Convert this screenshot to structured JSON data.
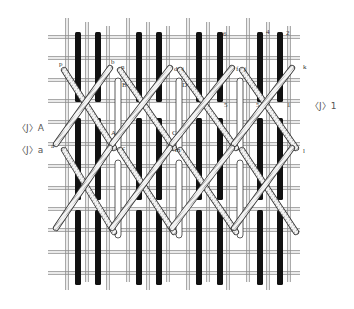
{
  "diagram": {
    "colors": {
      "background": "#ffffff",
      "canvas_thread": "#8a8a8a",
      "upright_stitch": "#111111",
      "laid_stitch_fill": "#ffffff",
      "laid_stitch_outline": "#333333",
      "diagonal_fill": "#f4f4f4",
      "diagonal_hatch": "#444444"
    },
    "point_labels": {
      "p": "p",
      "b": "b",
      "n": "n",
      "B": "B",
      "A": "A",
      "C": "C",
      "a": "a",
      "c": "c",
      "m": "m",
      "d": "d",
      "i": "i",
      "D": "D",
      "f": "f",
      "j": "j",
      "k": "k",
      "l": "l",
      "two": "2",
      "four": "4",
      "five_a": "5",
      "five_b": "5",
      "six": "6",
      "one": "1",
      "three": "3"
    },
    "side_labels": {
      "left_upper": "〈J〉A",
      "left_lower": "〈J〉a",
      "right": "〈J〉1"
    }
  }
}
